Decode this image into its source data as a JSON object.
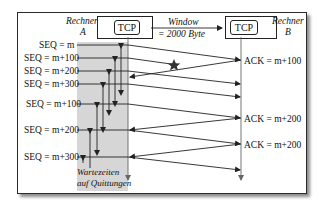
{
  "diagram": {
    "host_a": {
      "label_line1": "Rechner",
      "label_line2": "A",
      "box_label": "TCP"
    },
    "host_b": {
      "label_line1": "Rechner",
      "label_line2": "B",
      "box_label": "TCP"
    },
    "window": {
      "line1": "Window",
      "line2": "= 2000 Byte"
    },
    "wait_label": {
      "line1": "Wartezeiten",
      "line2": "auf Quittungen"
    },
    "seq_labels": [
      "SEQ = m",
      "SEQ = m+100",
      "SEQ = m+200",
      "SEQ = m+300",
      "SEQ = m+100",
      "SEQ = m+200",
      "SEQ = m+300"
    ],
    "ack_labels": [
      "ACK = m+100",
      "ACK = m+200",
      "ACK = m+200"
    ],
    "lost_marker": "star-icon",
    "colors": {
      "line": "#222222",
      "shade": "#d6d6d6",
      "frame": "#2a2a2a"
    }
  }
}
